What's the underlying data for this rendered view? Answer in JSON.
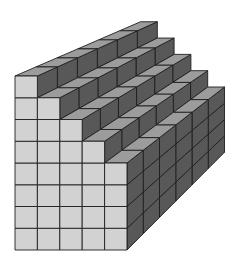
{
  "diagram": {
    "title": "",
    "columns": 5,
    "depth": 6,
    "column_heights": [
      8,
      7,
      6,
      5,
      4
    ],
    "front_origin": {
      "x": 15,
      "y": 250
    },
    "cell_size": {
      "w": 22.4,
      "h": 21.75
    },
    "vanishing_point": {
      "x": 517,
      "y": -141
    },
    "depth_fraction": 0.25,
    "colors": {
      "front_face": "#d2d2d2",
      "top_face": "#9c9c9c",
      "side_face": "#585858",
      "edge": "#1e1e1e",
      "background": "#ffffff"
    }
  }
}
